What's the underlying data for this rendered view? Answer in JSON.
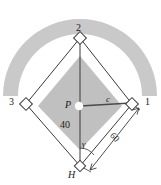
{
  "figure": {
    "type": "baseball-diamond-geometry-diagram",
    "colors": {
      "outfield_arc": "#c9c9c9",
      "infield_dirt": "#c0c0c0",
      "baselines_fill": "#ffffff",
      "line": "#3a3a3a",
      "text": "#1a1a1a",
      "mound": "#ffffff"
    },
    "bases": {
      "home": "H",
      "first": "1",
      "second": "2",
      "third": "3"
    },
    "points": {
      "pitcher": "P"
    },
    "segments": {
      "pitcher_to_first": "c",
      "pitcher_to_home": "40",
      "home_to_first": "60"
    },
    "angles": {
      "at_home": "γ"
    }
  }
}
